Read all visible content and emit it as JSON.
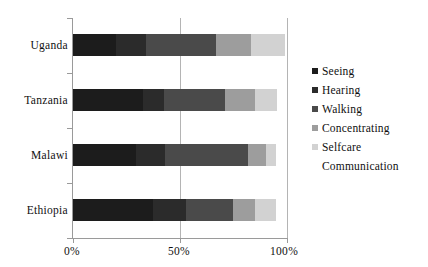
{
  "chart_data": {
    "type": "bar",
    "subtype": "stacked-horizontal-100-percent",
    "title": "",
    "xlabel": "",
    "ylabel": "",
    "categories": [
      "Uganda",
      "Tanzania",
      "Malawi",
      "Ethiopia"
    ],
    "xlim": [
      0,
      100
    ],
    "xticks": [
      0,
      50,
      100
    ],
    "xtick_labels": [
      "0%",
      "50%",
      "100%"
    ],
    "grid": "vertical gridlines at 50% and 100%",
    "legend_position": "right",
    "series": [
      {
        "name": "Seeing",
        "color": "#1c1c1c",
        "values": [
          20.0,
          32.5,
          29.5,
          37.5
        ]
      },
      {
        "name": "Hearing",
        "color": "#2b2b2b",
        "values": [
          14.0,
          10.0,
          13.5,
          15.5
        ]
      },
      {
        "name": "Walking",
        "color": "#4a4a4a",
        "values": [
          33.0,
          28.5,
          39.0,
          22.0
        ]
      },
      {
        "name": "Concentrating",
        "color": "#9d9d9d",
        "values": [
          16.0,
          14.0,
          8.0,
          10.0
        ]
      },
      {
        "name": "Selfcare",
        "color": "#d2d2d2",
        "values": [
          16.0,
          10.5,
          5.0,
          10.0
        ]
      },
      {
        "name": "Communication",
        "color": "#efefef",
        "values": [
          0.0,
          0.0,
          0.0,
          0.0
        ]
      }
    ],
    "bar_totals": [
      99.0,
      95.5,
      95.0,
      95.0
    ],
    "series_stacked_cumulative": {
      "Uganda": [
        20.0,
        34.0,
        67.0,
        83.0,
        99.0,
        99.0
      ],
      "Tanzania": [
        32.5,
        42.5,
        71.0,
        85.0,
        95.5,
        95.5
      ],
      "Malawi": [
        29.5,
        43.0,
        82.0,
        90.0,
        95.0,
        95.0
      ],
      "Ethiopia": [
        37.5,
        53.0,
        75.0,
        85.0,
        95.0,
        95.0
      ]
    }
  },
  "legend": {
    "items": [
      {
        "label": "Seeing",
        "color": "#1c1c1c",
        "swatch_visible": true
      },
      {
        "label": "Hearing",
        "color": "#2b2b2b",
        "swatch_visible": true
      },
      {
        "label": "Walking",
        "color": "#4a4a4a",
        "swatch_visible": true
      },
      {
        "label": "Concentrating",
        "color": "#9d9d9d",
        "swatch_visible": true
      },
      {
        "label": "Selfcare",
        "color": "#d2d2d2",
        "swatch_visible": true
      },
      {
        "label": "Communication",
        "color": "#ffffff",
        "swatch_visible": false
      }
    ]
  },
  "axis": {
    "x_tick_labels": [
      "0%",
      "50%",
      "100%"
    ],
    "y_tick_labels": [
      "Uganda",
      "Tanzania",
      "Malawi",
      "Ethiopia"
    ]
  },
  "colors": {
    "axis_line": "#9a9a9a",
    "gridline": "#b4b4b4",
    "text": "#101010",
    "background": "#ffffff"
  }
}
